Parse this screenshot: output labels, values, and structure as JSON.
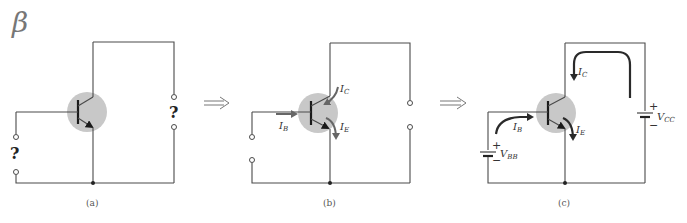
{
  "title_symbol": "β",
  "transition_arrows": [
    "⇒",
    "⇒"
  ],
  "panels": [
    {
      "id": "a",
      "caption": "(a)",
      "unknown_input_label": "?",
      "unknown_output_label": "?"
    },
    {
      "id": "b",
      "caption": "(b)",
      "currents": {
        "base": {
          "main": "I",
          "sub": "B"
        },
        "collector": {
          "main": "I",
          "sub": "C"
        },
        "emitter": {
          "main": "I",
          "sub": "E"
        }
      }
    },
    {
      "id": "c",
      "caption": "(c)",
      "currents": {
        "base": {
          "main": "I",
          "sub": "B"
        },
        "collector": {
          "main": "I",
          "sub": "C"
        },
        "emitter": {
          "main": "I",
          "sub": "E"
        }
      },
      "sources": {
        "base_supply": {
          "main": "V",
          "sub": "BB",
          "plus": "+",
          "minus": "−"
        },
        "collector_supply": {
          "main": "V",
          "sub": "CC",
          "plus": "+",
          "minus": "−"
        }
      }
    }
  ],
  "colors": {
    "wire": "#4a4a4a",
    "transistor_highlight": "#c8c8c8",
    "current_arrow_dark": "#2a2a2a",
    "current_arrow_gray": "#666666"
  }
}
